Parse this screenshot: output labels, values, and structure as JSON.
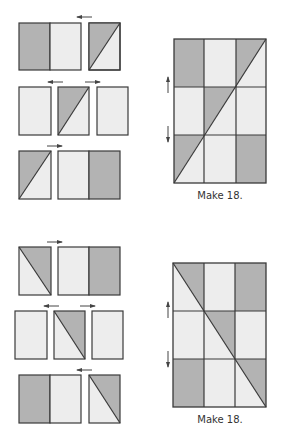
{
  "colors": {
    "dark": "#b3b3b3",
    "light": "#ededed",
    "stroke": "#3a3a3a",
    "arrow": "#444444",
    "background": "#ffffff"
  },
  "sections": [
    {
      "name": "upper-unit",
      "label": "Make 18.",
      "piece_rows": [
        {
          "pieces": [
            "dark-rect",
            "light-rect",
            "hst-ul-dark-rising"
          ],
          "arrows": [
            "left"
          ]
        },
        {
          "pieces": [
            "light-rect",
            "hst-ul-dark-rising",
            "light-rect"
          ],
          "arrows": [
            "left",
            "right"
          ]
        },
        {
          "pieces": [
            "hst-ul-dark-rising",
            "light-rect",
            "dark-rect"
          ],
          "arrows": [
            "right"
          ]
        }
      ],
      "grid": [
        [
          "dark",
          "light",
          "hst-rising"
        ],
        [
          "light",
          "hst-rising",
          "light"
        ],
        [
          "hst-rising",
          "light",
          "dark"
        ]
      ],
      "seam_arrows": [
        "up",
        "down"
      ]
    },
    {
      "name": "lower-unit",
      "label": "Make 18.",
      "piece_rows": [
        {
          "pieces": [
            "hst-ur-dark-falling",
            "light-rect",
            "dark-rect"
          ],
          "arrows": [
            "right"
          ]
        },
        {
          "pieces": [
            "light-rect",
            "hst-ur-dark-falling",
            "light-rect"
          ],
          "arrows": [
            "left",
            "right"
          ]
        },
        {
          "pieces": [
            "dark-rect",
            "light-rect",
            "hst-ur-dark-falling"
          ],
          "arrows": [
            "left"
          ]
        }
      ],
      "grid": [
        [
          "hst-falling",
          "light",
          "dark"
        ],
        [
          "light",
          "hst-falling",
          "light"
        ],
        [
          "dark",
          "light",
          "hst-falling"
        ]
      ],
      "seam_arrows": [
        "up",
        "down"
      ]
    }
  ]
}
